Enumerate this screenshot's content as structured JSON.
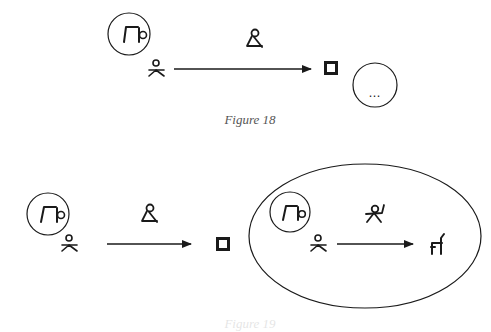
{
  "figures": [
    {
      "caption": "Figure 18",
      "elements": {
        "source_circle_icon": "bent-over-figure-icon",
        "agent_icon": "seated-person-icon",
        "arrow_label_icon": "kneeling-figure-icon",
        "target_icon": "double-square-icon",
        "result_circle_content": "…"
      }
    },
    {
      "caption": "Figure 19",
      "elements": {
        "source_circle_icon": "bent-over-figure-icon",
        "agent_icon": "seated-person-icon",
        "arrow_label_icon": "kneeling-figure-icon",
        "target_icon": "double-square-icon",
        "embedded_ellipse": {
          "source_circle_icon": "bent-over-figure-icon",
          "agent_icon": "seated-person-icon",
          "arrow_label_icon": "jumping-figure-icon",
          "target_icon": "chair-animal-icon"
        }
      }
    }
  ],
  "colors": {
    "ink": "#1a1a1a",
    "caption": "#555555",
    "background": "#ffffff"
  }
}
